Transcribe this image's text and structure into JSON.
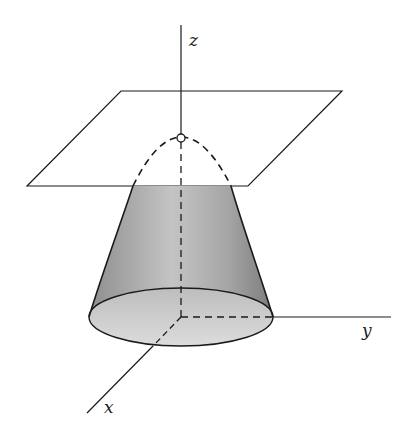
{
  "diagram": {
    "axes": {
      "z_label": "z",
      "y_label": "y",
      "x_label": "x"
    },
    "colors": {
      "line": "#1a1a1a",
      "surface_dark": "#8a8a8a",
      "surface_light": "#d8d8d8",
      "background": "#ffffff"
    },
    "elements": [
      "tangent-plane",
      "apex-point",
      "paraboloid-surface",
      "base-ellipse",
      "hidden-dashed-curve",
      "coordinate-axes"
    ]
  }
}
